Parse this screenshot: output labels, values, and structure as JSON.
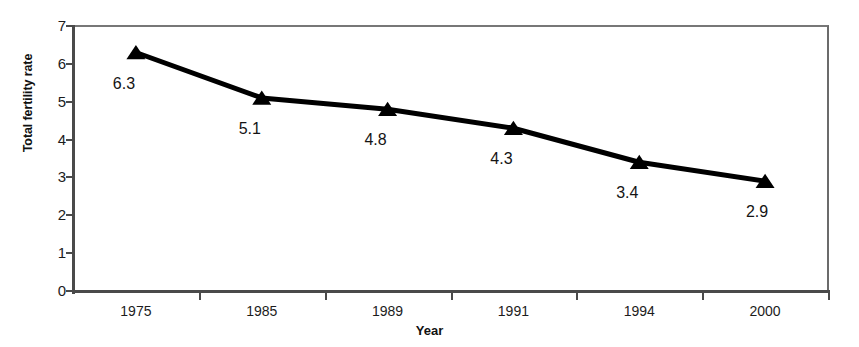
{
  "chart_data": {
    "type": "line",
    "title": "",
    "subtitle": "",
    "xlabel": "Year",
    "ylabel": "Total fertility rate",
    "categories": [
      "1975",
      "1985",
      "1989",
      "1991",
      "1994",
      "2000"
    ],
    "values": [
      6.3,
      5.1,
      4.8,
      4.3,
      3.4,
      2.9
    ],
    "point_labels": [
      "6.3",
      "5.1",
      "4.8",
      "4.3",
      "3.4",
      "2.9"
    ],
    "ylim": [
      0,
      7
    ],
    "ytick_labels": [
      "0",
      "1",
      "2",
      "3",
      "4",
      "5",
      "6",
      "7"
    ],
    "ytick_values": [
      0,
      1,
      2,
      3,
      4,
      5,
      6,
      7
    ],
    "grid": false,
    "legend": false,
    "legend_position": "none",
    "marker": "triangle",
    "series_color": "#000000",
    "frame_color": "#6b6b6b",
    "background_color": "#ffffff"
  }
}
